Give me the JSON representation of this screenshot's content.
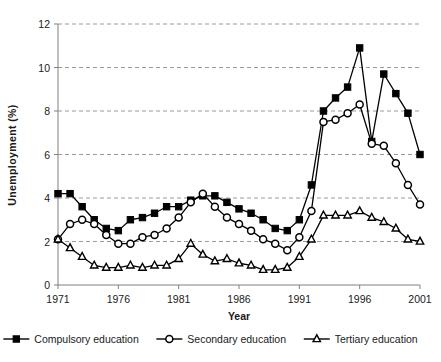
{
  "chart_data": {
    "type": "line",
    "title": "",
    "xlabel": "Year",
    "ylabel": "Unemployment (%)",
    "xlim": [
      1971,
      2001
    ],
    "ylim": [
      0,
      12
    ],
    "ytick_step": 2,
    "xtick_step": 5,
    "grid": "horizontal-dashed",
    "legend_position": "bottom",
    "x": [
      1971,
      1972,
      1973,
      1974,
      1975,
      1976,
      1977,
      1978,
      1979,
      1980,
      1981,
      1982,
      1983,
      1984,
      1985,
      1986,
      1987,
      1988,
      1989,
      1990,
      1991,
      1992,
      1993,
      1994,
      1995,
      1996,
      1997,
      1998,
      1999,
      2000,
      2001
    ],
    "xticks": [
      "1971",
      "1976",
      "1981",
      "1986",
      "1991",
      "1996",
      "2001"
    ],
    "yticks": [
      "0",
      "2",
      "4",
      "6",
      "8",
      "10",
      "12"
    ],
    "series": [
      {
        "name": "Compulsory education",
        "marker": "filled-square",
        "color": "#000000",
        "values": [
          4.2,
          4.2,
          3.6,
          3.0,
          2.6,
          2.5,
          3.0,
          3.1,
          3.3,
          3.6,
          3.6,
          3.9,
          4.1,
          4.1,
          3.8,
          3.5,
          3.3,
          3.0,
          2.6,
          2.5,
          3.0,
          4.6,
          8.0,
          8.6,
          9.1,
          10.9,
          6.6,
          9.7,
          8.8,
          7.9,
          6.0
        ]
      },
      {
        "name": "Secondary education",
        "marker": "open-circle",
        "color": "#000000",
        "values": [
          2.1,
          2.8,
          3.0,
          2.8,
          2.3,
          1.9,
          1.9,
          2.2,
          2.3,
          2.6,
          3.1,
          3.8,
          4.2,
          3.6,
          3.1,
          2.8,
          2.5,
          2.1,
          1.9,
          1.6,
          2.2,
          3.4,
          7.5,
          7.6,
          7.9,
          8.3,
          6.5,
          6.4,
          5.6,
          4.6,
          3.7
        ]
      },
      {
        "name": "Tertiary education",
        "marker": "open-triangle",
        "color": "#000000",
        "values": [
          2.1,
          1.7,
          1.3,
          0.9,
          0.8,
          0.8,
          0.9,
          0.8,
          0.9,
          0.9,
          1.2,
          1.9,
          1.4,
          1.1,
          1.2,
          1.0,
          0.9,
          0.7,
          0.7,
          0.8,
          1.3,
          2.1,
          3.2,
          3.2,
          3.2,
          3.4,
          3.1,
          2.9,
          2.6,
          2.1,
          2.0
        ]
      }
    ]
  },
  "axes": {
    "x_title": "Year",
    "y_title": "Unemployment (%)"
  },
  "legend": {
    "items": [
      {
        "label": "Compulsory education",
        "marker": "filled-square"
      },
      {
        "label": "Secondary education",
        "marker": "open-circle"
      },
      {
        "label": "Tertiary education",
        "marker": "open-triangle"
      }
    ]
  }
}
